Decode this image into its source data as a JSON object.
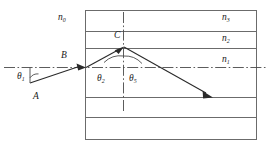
{
  "figure": {
    "type": "optics-ray-diagram",
    "colors": {
      "line": "#6b6b6b",
      "ray": "#2a2a2a",
      "text": "#1a1a1a",
      "background": "#ffffff"
    },
    "media_labels": [
      {
        "id": "n0",
        "base": "n",
        "sub": "0",
        "x": 58,
        "y": 13
      },
      {
        "id": "n3",
        "base": "n",
        "sub": "3",
        "x": 222,
        "y": 13
      },
      {
        "id": "n2",
        "base": "n",
        "sub": "2",
        "x": 222,
        "y": 34
      },
      {
        "id": "n1",
        "base": "n",
        "sub": "1",
        "x": 222,
        "y": 55
      }
    ],
    "point_labels": [
      {
        "id": "C",
        "text": "C",
        "x": 114,
        "y": 31
      },
      {
        "id": "B",
        "text": "B",
        "x": 61,
        "y": 51
      },
      {
        "id": "A",
        "text": "A",
        "x": 33,
        "y": 92
      }
    ],
    "angle_labels": [
      {
        "id": "theta1",
        "base": "θ",
        "sub": "1",
        "x": 17,
        "y": 72
      },
      {
        "id": "theta2",
        "base": "θ",
        "sub": "2",
        "x": 97,
        "y": 74
      },
      {
        "id": "theta5",
        "base": "θ",
        "sub": "5",
        "x": 129,
        "y": 74
      }
    ]
  }
}
